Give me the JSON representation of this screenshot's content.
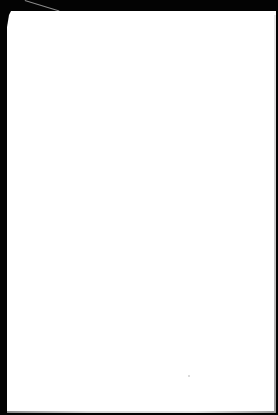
{
  "scene": {
    "description": "Blank white sheet of paper on black background",
    "background_color": "#000000",
    "paper_color": "#ffffff"
  },
  "page": {
    "text": ""
  }
}
